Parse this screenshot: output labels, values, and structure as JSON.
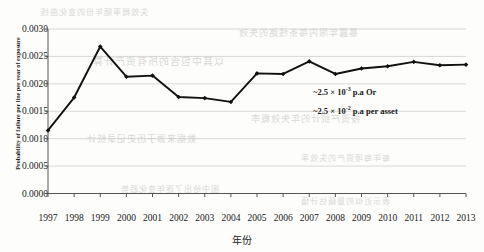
{
  "chart_data": {
    "type": "line",
    "title": "",
    "xlabel": "年份",
    "ylabel": "Probability of failure per line per year of exposure",
    "categories": [
      "1997",
      "1998",
      "1999",
      "2000",
      "2001",
      "2002",
      "2003",
      "2004",
      "2005",
      "2006",
      "2007",
      "2008",
      "2009",
      "2010",
      "2011",
      "2012",
      "2013"
    ],
    "values": [
      0.00115,
      0.00175,
      0.00268,
      0.00213,
      0.00215,
      0.00176,
      0.00174,
      0.00167,
      0.00219,
      0.00218,
      0.00241,
      0.00218,
      0.00228,
      0.00232,
      0.0024,
      0.00234,
      0.00235
    ],
    "ylim": [
      0.0,
      0.003
    ],
    "yticks": [
      "0.0000",
      "0.0005",
      "0.0010",
      "0.0015",
      "0.0020",
      "0.0025",
      "0.0030"
    ],
    "ytick_values": [
      0.0,
      0.0005,
      0.001,
      0.0015,
      0.002,
      0.0025,
      0.003
    ],
    "grid": true,
    "grid_axis": "y",
    "legend": "none",
    "series_color": "#111111",
    "grid_color": "#c8c8c8",
    "marker": "diamond",
    "annotations": [
      {
        "text_plain": "~2.5 × 10-3 p.a Or",
        "prefix": "~2.5 × 10",
        "exponent": "-3",
        "suffix": " p.a Or"
      },
      {
        "text_plain": "~2.5 × 10-2 p.a per asset",
        "prefix": "~2.5 × 10",
        "exponent": "-2",
        "suffix": " p.a per asset"
      }
    ]
  },
  "ghost_text": {
    "g1": "暴露年限内每条线路的失效",
    "g2": "以其中包含的所有资产计算",
    "g3": "按资产统计的年失效概率",
    "g4": "数据来源于历史记录统计",
    "g5": "每年每项资产的失效率",
    "g6": "图中给出了逐年变化趋势",
    "g7": "表示近似的量级估计值",
    "g8": "失效概率随年份的变化曲线"
  }
}
